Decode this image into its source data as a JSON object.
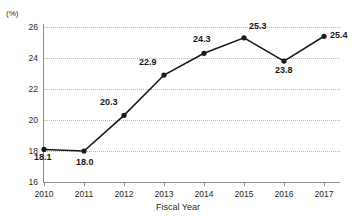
{
  "chart_data": {
    "type": "line",
    "title": "",
    "xlabel": "Fiscal Year",
    "ylabel": "",
    "unit_label": "(%)",
    "categories": [
      "2010",
      "2011",
      "2012",
      "2013",
      "2014",
      "2015",
      "2016",
      "2017"
    ],
    "values": [
      18.1,
      18.0,
      20.3,
      22.9,
      24.3,
      25.3,
      23.8,
      25.4
    ],
    "point_labels": [
      "18.1",
      "18.0",
      "20.3",
      "22.9",
      "24.3",
      "25.3",
      "23.8",
      "25.4"
    ],
    "ylim": [
      16,
      26
    ],
    "yticks": [
      16,
      18,
      20,
      22,
      24,
      26
    ],
    "ytick_labels": [
      "16",
      "18",
      "20",
      "22",
      "24",
      "26"
    ],
    "grid": true,
    "legend": "none",
    "series": [
      {
        "name": "",
        "values": [
          18.1,
          18.0,
          20.3,
          22.9,
          24.3,
          25.3,
          23.8,
          25.4
        ],
        "color": "#1a1a1a",
        "marker": "circle"
      }
    ],
    "colors": {
      "line": "#1a1a1a",
      "marker": "#1a1a1a",
      "axis": "#8d8d8d",
      "grid": "#b9b9b9",
      "text": "#2b2b2b",
      "background": "#ffffff"
    }
  }
}
